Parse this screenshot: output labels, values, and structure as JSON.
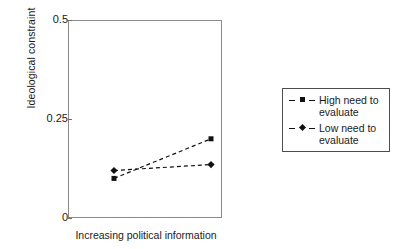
{
  "chart_data": {
    "type": "line",
    "title": "",
    "xlabel": "Increasing political information",
    "ylabel": "Ideological constraint",
    "x": [
      1,
      2
    ],
    "xticklabels": [],
    "yticklabels": [
      "0.5",
      "0.25",
      "0"
    ],
    "ytickvalues": [
      0.5,
      0.25,
      0
    ],
    "ylim": [
      0,
      0.5
    ],
    "xlim": [
      0,
      3
    ],
    "grid": false,
    "legend_position": "right-outside",
    "series": [
      {
        "name": "High need to evaluate",
        "marker": "square",
        "linestyle": "dashed",
        "color": "#111111",
        "values": [
          0.1,
          0.2
        ]
      },
      {
        "name": "Low need to evaluate",
        "marker": "diamond",
        "linestyle": "dashed",
        "color": "#111111",
        "values": [
          0.12,
          0.135
        ]
      }
    ]
  },
  "axes": {
    "y_title": "Ideological constraint",
    "x_title": "Increasing political information",
    "y_ticks": [
      {
        "label": "0.5",
        "value": 0.5
      },
      {
        "label": "0.25",
        "value": 0.25
      },
      {
        "label": "0",
        "value": 0
      }
    ]
  },
  "legend": {
    "entries": [
      {
        "label": "High need to\nevaluate",
        "marker": "square-marker"
      },
      {
        "label": "Low need to\nevaluate",
        "marker": "diamond-marker"
      }
    ]
  },
  "style": {
    "ink": "#111111",
    "frame": "#8b8b8b",
    "background": "#ffffff"
  }
}
